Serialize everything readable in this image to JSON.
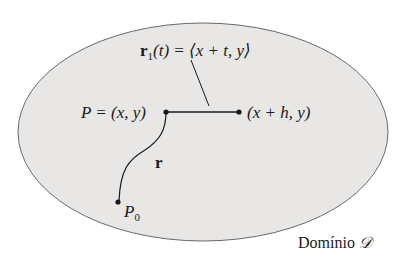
{
  "diagram": {
    "region_fill": "#e8e7e5",
    "stroke_color": "#1a1a1a",
    "domain_label": "Domínio",
    "domain_symbol": "𝒟",
    "curve_label": "r",
    "path_label": {
      "r": "r",
      "sub": "1",
      "rest": "(t) = ⟨x + t, y⟩"
    },
    "point_p_label": "P = (x, y)",
    "point_h_label": "(x + h, y)",
    "point_p0": {
      "base": "P",
      "sub": "0"
    }
  }
}
